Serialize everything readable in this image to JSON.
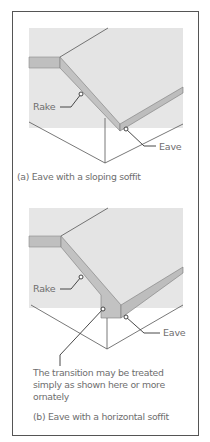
{
  "figure": {
    "panel_a": {
      "labels": {
        "rake": "Rake",
        "eave": "Eave"
      },
      "caption": "(a) Eave with a sloping soffit"
    },
    "panel_b": {
      "labels": {
        "rake": "Rake",
        "eave": "Eave"
      },
      "note": "The transition may be treated simply as shown here or more ornately",
      "caption": "(b) Eave with a horizontal soffit"
    },
    "colors": {
      "frame": "#555555",
      "roof_surface": "#e4e4e4",
      "roof_edge": "#bdbdbd",
      "text": "#6e6e6e",
      "lines": "#555555"
    }
  }
}
